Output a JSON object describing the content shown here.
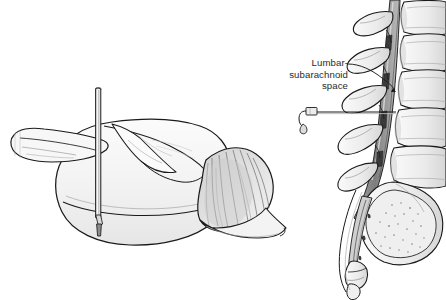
{
  "figure": {
    "background_color": "#ffffff",
    "width": 446,
    "height": 300,
    "ink_color": "#1a1a1a",
    "fill_light": "#f3f3f3",
    "fill_mid": "#dcdcdc",
    "fill_dark": "#8f8f8f",
    "canal_color": "#6f6f6f"
  },
  "annotations": {
    "lumbar_subarachnoid": {
      "line1": "Lumbar-",
      "line2": "subarachnoid",
      "line3": "space",
      "text_color": "#2b2b2b",
      "leader_color": "#1a1a1a"
    }
  },
  "panels": {
    "left": {
      "name": "draped-patient",
      "description": "Patient in lateral decubitus position covered by sterile drape with vertical needle marker"
    },
    "right": {
      "name": "lumbar-spine-sagittal",
      "description": "Sagittal view of lumbar vertebrae, sacrum and coccyx with spinal canal and inserted needle"
    }
  },
  "elements": {
    "needle_vertical": "vertical-needle-marker",
    "needle_spinal": "spinal-needle",
    "drape_fan": "gathered-drape-folds",
    "vertebrae_count": 5,
    "sacrum": "sacrum",
    "coccyx": "coccyx"
  }
}
